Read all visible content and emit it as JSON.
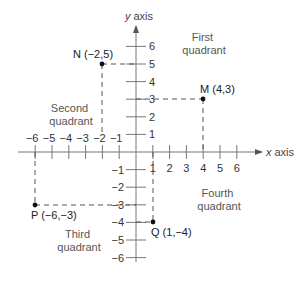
{
  "axes": {
    "x_title_var": "x",
    "x_title_word": "axis",
    "y_title_var": "y",
    "y_title_word": "axis",
    "x_ticks": [
      "−6",
      "−5",
      "−4",
      "−3",
      "−2",
      "−1",
      "1",
      "2",
      "3",
      "4",
      "5",
      "6"
    ],
    "y_ticks": [
      "6",
      "5",
      "4",
      "3",
      "2",
      "1",
      "−1",
      "−2",
      "−3",
      "−4",
      "−5",
      "−6"
    ]
  },
  "quadrants": {
    "first": [
      "First",
      "quadrant"
    ],
    "second": [
      "Second",
      "quadrant"
    ],
    "third": [
      "Third",
      "quadrant"
    ],
    "fourth": [
      "Fourth",
      "quadrant"
    ]
  },
  "points": {
    "N": "N (−2,5)",
    "M": "M (4,3)",
    "P": "P (−6,−3)",
    "Q": "Q (1,−4)"
  },
  "chart_data": {
    "type": "scatter",
    "title": "",
    "xlabel": "x axis",
    "ylabel": "y axis",
    "xlim": [
      -6,
      6
    ],
    "ylim": [
      -6,
      6
    ],
    "grid": false,
    "points": [
      {
        "label": "N",
        "x": -2,
        "y": 5
      },
      {
        "label": "M",
        "x": 4,
        "y": 3
      },
      {
        "label": "P",
        "x": -6,
        "y": -3
      },
      {
        "label": "Q",
        "x": 1,
        "y": -4
      }
    ],
    "annotations": [
      "First quadrant",
      "Second quadrant",
      "Third quadrant",
      "Fourth quadrant"
    ]
  }
}
